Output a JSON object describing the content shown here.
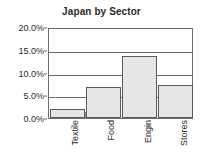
{
  "chart_data": {
    "type": "bar",
    "title": "Japan by Sector",
    "xlabel": "",
    "ylabel": "",
    "categories": [
      "Textile",
      "Food",
      "Engin",
      "Stores"
    ],
    "values": [
      2.0,
      6.9,
      13.6,
      7.3
    ],
    "ylim": [
      0,
      20
    ],
    "ytick_values": [
      0,
      5,
      10,
      15,
      20
    ],
    "ytick_labels": [
      "0.0%",
      "5.0%",
      "10.0%",
      "15.0%",
      "20.0%"
    ],
    "grid": true,
    "legend": "none",
    "value_format": "percent",
    "series": [
      {
        "name": "Japan by Sector",
        "values": [
          2.0,
          6.9,
          13.6,
          7.3
        ]
      }
    ],
    "colors": {
      "bar_fill": "#e6e6e6",
      "bar_border": "#5a5a5a",
      "axis": "#6f6f6f",
      "text": "#2b2b2b",
      "background": "#ffffff"
    }
  }
}
